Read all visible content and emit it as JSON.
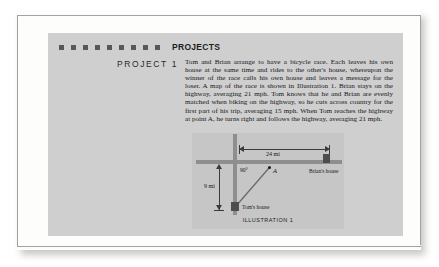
{
  "document": {
    "section_heading": "PROJECTS",
    "project_label": "PROJECT 1",
    "body_text": "Tom and Brian arrange to have a bicycle race. Each leaves his own house at the same time and rides to the other's house, whereupon the winner of the race calls his own house and leaves a message for the loser. A map of the race is shown in Illustration 1. Brian stays on the highway, averaging 21 mph. Tom knows that he and Brian are evenly matched when biking on the highway, so he cuts across country for the first part of his trip, averaging 15 mph. When Tom reaches the highway at point A, he turns right and follows the highway, averaging 21 mph.",
    "decorative_square_count": 9
  },
  "illustration": {
    "caption": "ILLUSTRATION 1",
    "horizontal_distance_label": "24 mi",
    "vertical_distance_label": "9 mi",
    "angle_label": "90°",
    "point_label": "A",
    "brian_house_label": "Brian's house",
    "tom_house_label": "Tom's house"
  },
  "colors": {
    "panel_background": "#cfcfcf",
    "illustration_background": "#c6c6c6",
    "road": "#8e8e90",
    "marker": "#4d4d4f",
    "ink": "#16161a",
    "square": "#58585a",
    "sheet": "#fdfdfc"
  }
}
